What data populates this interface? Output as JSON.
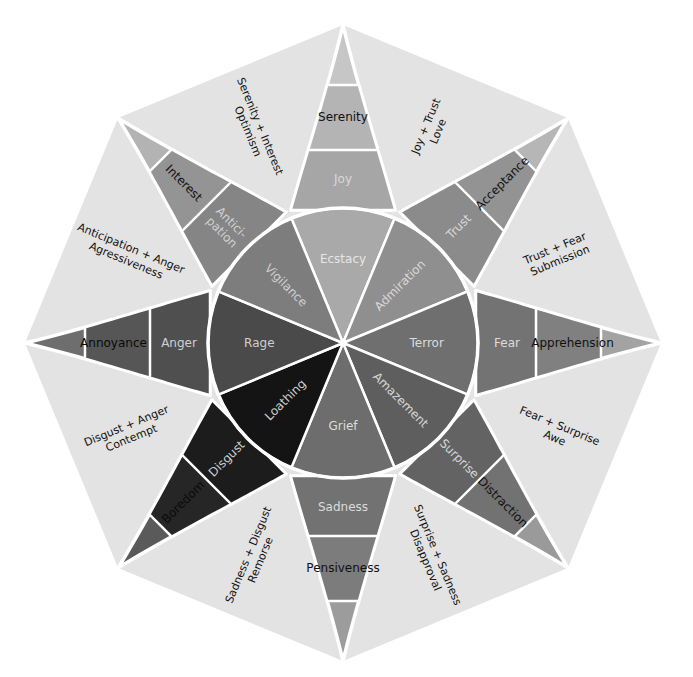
{
  "colors": {
    "background": "#ffffff",
    "octagon_fill": "#e3e3e3",
    "seam": "#ffffff"
  },
  "petals": [
    {
      "id": "joy",
      "angle": 0,
      "inner": "Ecstacy",
      "middle": "Joy",
      "outer": "Serenity",
      "fills": [
        "#a9a9a9",
        "#a6a6a6",
        "#b4b4b4",
        "#c6c6c6"
      ],
      "inner_text": "#e6e6e6",
      "middle_text": "#d9d9d9",
      "outer_text": "#111111"
    },
    {
      "id": "trust",
      "angle": 45,
      "inner": "Admiration",
      "middle": "Trust",
      "outer": "Acceptance",
      "fills": [
        "#8f8f8f",
        "#8b8b8b",
        "#939393",
        "#b6b6b6"
      ],
      "inner_text": "#d9d9d9",
      "middle_text": "#d9d9d9",
      "outer_text": "#111111"
    },
    {
      "id": "fear",
      "angle": 90,
      "inner": "Terror",
      "middle": "Fear",
      "outer": "Apprehension",
      "fills": [
        "#6f6f6f",
        "#737373",
        "#808080",
        "#a3a3a3"
      ],
      "inner_text": "#dcdcdc",
      "middle_text": "#dcdcdc",
      "outer_text": "#111111"
    },
    {
      "id": "surprise",
      "angle": 135,
      "inner": "Amazement",
      "middle": "Surprise",
      "outer": "Distraction",
      "fills": [
        "#5e5e5e",
        "#636363",
        "#727272",
        "#9a9a9a"
      ],
      "inner_text": "#d6d6d6",
      "middle_text": "#d6d6d6",
      "outer_text": "#111111"
    },
    {
      "id": "sadness",
      "angle": 180,
      "inner": "Grief",
      "middle": "Sadness",
      "outer": "Pensiveness",
      "fills": [
        "#6d6d6d",
        "#727272",
        "#7c7c7c",
        "#9c9c9c"
      ],
      "inner_text": "#dcdcdc",
      "middle_text": "#dcdcdc",
      "outer_text": "#111111"
    },
    {
      "id": "disgust",
      "angle": 225,
      "inner": "Loathing",
      "middle": "Disgust",
      "outer": "Boredom",
      "fills": [
        "#141414",
        "#1c1c1c",
        "#262626",
        "#5a5a5a"
      ],
      "inner_text": "#cfcfcf",
      "middle_text": "#cfcfcf",
      "outer_text": "#0a0a0a"
    },
    {
      "id": "anger",
      "angle": 270,
      "inner": "Rage",
      "middle": "Anger",
      "outer": "Annoyance",
      "fills": [
        "#4a4a4a",
        "#4f4f4f",
        "#565656",
        "#6e6e6e"
      ],
      "inner_text": "#cfcfcf",
      "middle_text": "#cfcfcf",
      "outer_text": "#0a0a0a"
    },
    {
      "id": "anticipation",
      "angle": 315,
      "inner": "Vigilance",
      "middle": "Anticipation",
      "outer": "Interest",
      "fills": [
        "#7d7d7d",
        "#858585",
        "#949494",
        "#b3b3b3"
      ],
      "inner_text": "#d0d0d0",
      "middle_text": "#d0d0d0",
      "outer_text": "#111111"
    }
  ],
  "combinations": [
    {
      "angle": 22.5,
      "line1": "Joy + Trust",
      "line2": "Love"
    },
    {
      "angle": 67.5,
      "line1": "Trust + Fear",
      "line2": "Submission"
    },
    {
      "angle": 112.5,
      "line1": "Fear + Surprise",
      "line2": "Awe"
    },
    {
      "angle": 157.5,
      "line1": "Surprise + Sadness",
      "line2": "Disapproval"
    },
    {
      "angle": 202.5,
      "line1": "Sadness + Disgust",
      "line2": "Remorse"
    },
    {
      "angle": 247.5,
      "line1": "Disgust + Anger",
      "line2": "Contempt"
    },
    {
      "angle": 292.5,
      "line1": "Anticipation + Anger",
      "line2": "Agressiveness"
    },
    {
      "angle": 337.5,
      "line1": "Serenity + Interest",
      "line2": "Optimism"
    }
  ],
  "labels": {
    "anticipation_split_1": "Antici-",
    "anticipation_split_2": "pation"
  }
}
